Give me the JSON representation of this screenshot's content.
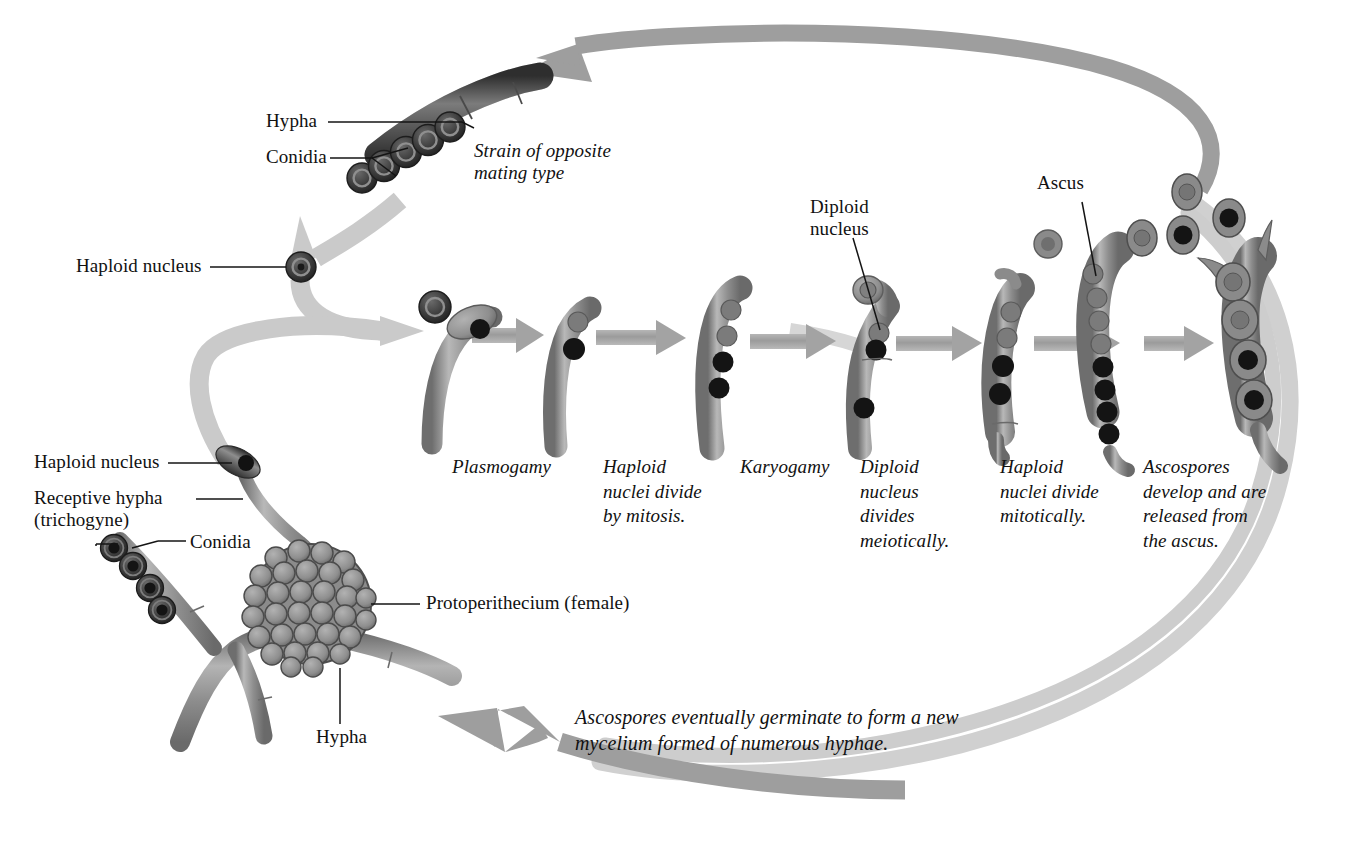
{
  "figure": {
    "background_color": "#ffffff",
    "ink_color": "#111111",
    "palette": {
      "hypha_fill": "#9a9a9a",
      "hypha_dark": "#4a4a4a",
      "hypha_edge": "#5d5d5d",
      "arrow_gray": "#9d9d9d",
      "arrow_pale": "#c9c9c9",
      "loop_pale": "#cfcfcf",
      "nucleus_dark": "#141414",
      "nucleus_light": "#777777",
      "conidium_outer": "#3a3a3a",
      "conidium_inner": "#6e6e6e"
    }
  },
  "labels": {
    "hypha_top": "Hypha",
    "conidia_top": "Conidia",
    "strain_opposite": "Strain of opposite\nmating type",
    "haploid_nucleus_upper": "Haploid nucleus",
    "haploid_nucleus_lower": "Haploid nucleus",
    "receptive_hypha": "Receptive hypha\n(trichogyne)",
    "conidia_lower": "Conidia",
    "protoperithecium": "Protoperithecium (female)",
    "hypha_bottom": "Hypha",
    "diploid_nucleus": "Diploid\nnucleus",
    "ascus": "Ascus"
  },
  "stages": [
    {
      "id": "plasmogamy",
      "text": "Plasmogamy"
    },
    {
      "id": "haploid-mitosis",
      "text": "Haploid\nnuclei divide\nby mitosis."
    },
    {
      "id": "karyogamy",
      "text": "Karyogamy"
    },
    {
      "id": "meiosis",
      "text": "Diploid\nnucleus\ndivides\nmeiotically."
    },
    {
      "id": "haploid-mitotic",
      "text": "Haploid\nnuclei divide\nmitotically."
    },
    {
      "id": "ascospores",
      "text": "Ascospores\ndevelop and are\nreleased from\nthe ascus."
    }
  ],
  "caption": {
    "germination": "Ascospores eventually germinate to form a new\nmycelium formed of numerous hyphae."
  },
  "cycle_content": {
    "type": "diagram",
    "title": "Ascomycete sexual life cycle",
    "nodes": [
      {
        "name": "Strain of opposite mating type",
        "detail": "hypha bearing a chain of 5 conidia, haploid nuclei"
      },
      {
        "name": "Haploid nucleus (conidium)",
        "detail": "single released conidium carrying one haploid nucleus"
      },
      {
        "name": "Protoperithecium (female)",
        "detail": "spherical cluster of many rounded cells on a hypha, bearing a receptive hypha (trichogyne)"
      },
      {
        "name": "Plasmogamy",
        "detail": "conidium fuses with trichogyne tip; two unfused nuclei (1 light, 1 dark)"
      },
      {
        "name": "Haploid nuclei divide by mitosis",
        "detail": "dikaryotic tip cell with 2 nuclei"
      },
      {
        "name": "Karyogamy",
        "detail": "4 nuclei aligned in the hook cell (2 light, 2 dark)"
      },
      {
        "name": "Diploid nucleus divides meiotically",
        "detail": "crozier with one diploid nucleus"
      },
      {
        "name": "Haploid nuclei divide mitotically",
        "detail": "young ascus with 4 nuclei"
      },
      {
        "name": "Ascus with 8 ascospores",
        "detail": "8 nuclei: 4 light and 4 dark"
      },
      {
        "name": "Ascospores released",
        "detail": "mature ascus discharges 4 free ascospores"
      }
    ],
    "arrow_sequence_count": 6,
    "return_loop": "Ascospores germinate to re-form the mycelium (outer loop back to the hypha at lower left)"
  }
}
